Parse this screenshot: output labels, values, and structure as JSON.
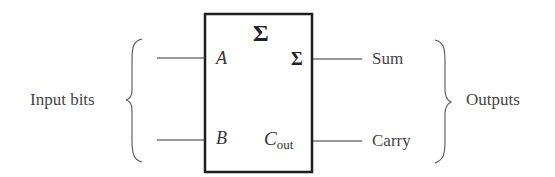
{
  "diagram": {
    "type": "half-adder block symbol",
    "block": {
      "symbol": "Σ",
      "inputs": [
        {
          "name": "A"
        },
        {
          "name": "B"
        }
      ],
      "outputs": [
        {
          "name": "Σ"
        },
        {
          "name_main": "C",
          "name_sub": "out"
        }
      ]
    },
    "left_group_label": "Input bits",
    "right_group_label": "Outputs",
    "output_labels": [
      "Sum",
      "Carry"
    ],
    "colors": {
      "stroke": "#222222",
      "text": "#444444",
      "background": "#ffffff"
    }
  }
}
